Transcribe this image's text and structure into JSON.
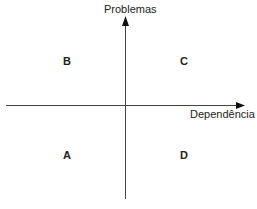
{
  "diagram": {
    "type": "quadrant",
    "axes": {
      "y_label": "Problemas",
      "x_label": "Dependência"
    },
    "quadrants": {
      "top_left": "B",
      "top_right": "C",
      "bottom_left": "A",
      "bottom_right": "D"
    },
    "line_color": "#333333"
  }
}
